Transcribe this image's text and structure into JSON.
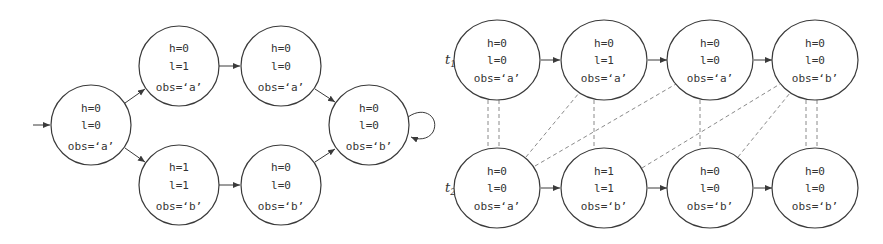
{
  "left_diagram": {
    "nodes": [
      {
        "id": "s0",
        "h": "h=0",
        "l": "l=0",
        "obs": "obs=‘a’",
        "cx": 91,
        "cy": 125
      },
      {
        "id": "s1",
        "h": "h=0",
        "l": "l=1",
        "obs": "obs=‘a’",
        "cx": 179,
        "cy": 66
      },
      {
        "id": "s2",
        "h": "h=0",
        "l": "l=0",
        "obs": "obs=‘a’",
        "cx": 281,
        "cy": 66
      },
      {
        "id": "s3",
        "h": "h=1",
        "l": "l=1",
        "obs": "obs=‘b’",
        "cx": 179,
        "cy": 185
      },
      {
        "id": "s4",
        "h": "h=0",
        "l": "l=0",
        "obs": "obs=‘b’",
        "cx": 281,
        "cy": 185
      },
      {
        "id": "s5",
        "h": "h=0",
        "l": "l=0",
        "obs": "obs=‘b’",
        "cx": 369,
        "cy": 125
      }
    ],
    "edges": [
      [
        "init",
        "s0"
      ],
      [
        "s0",
        "s1"
      ],
      [
        "s0",
        "s3"
      ],
      [
        "s1",
        "s2"
      ],
      [
        "s3",
        "s4"
      ],
      [
        "s2",
        "s5"
      ],
      [
        "s4",
        "s5"
      ],
      [
        "s5",
        "s5"
      ]
    ]
  },
  "right_diagram": {
    "traces": [
      {
        "label": "t",
        "subscript": "1",
        "nodes": [
          {
            "h": "h=0",
            "l": "l=0",
            "obs": "obs=‘a’"
          },
          {
            "h": "h=0",
            "l": "l=1",
            "obs": "obs=‘a’"
          },
          {
            "h": "h=0",
            "l": "l=0",
            "obs": "obs=‘a’"
          },
          {
            "h": "h=0",
            "l": "l=0",
            "obs": "obs=‘b’"
          }
        ]
      },
      {
        "label": "t",
        "subscript": "2",
        "nodes": [
          {
            "h": "h=0",
            "l": "l=0",
            "obs": "obs=‘a’"
          },
          {
            "h": "h=1",
            "l": "l=1",
            "obs": "obs=‘b’"
          },
          {
            "h": "h=0",
            "l": "l=0",
            "obs": "obs=‘b’"
          },
          {
            "h": "h=0",
            "l": "l=0",
            "obs": "obs=‘b’"
          }
        ]
      }
    ],
    "dashed_links": [
      {
        "t1": 0,
        "t2": 0,
        "style": "double"
      },
      {
        "t1": 1,
        "t2": 1,
        "style": "single"
      },
      {
        "t1": 2,
        "t2": 2,
        "style": "single"
      },
      {
        "t1": 3,
        "t2": 3,
        "style": "double"
      },
      {
        "t1": 1,
        "t2": 0,
        "style": "diagonal"
      },
      {
        "t1": 2,
        "t2": 0,
        "style": "diagonal"
      },
      {
        "t1": 3,
        "t2": 1,
        "style": "diagonal"
      },
      {
        "t1": 3,
        "t2": 2,
        "style": "diagonal"
      }
    ]
  }
}
